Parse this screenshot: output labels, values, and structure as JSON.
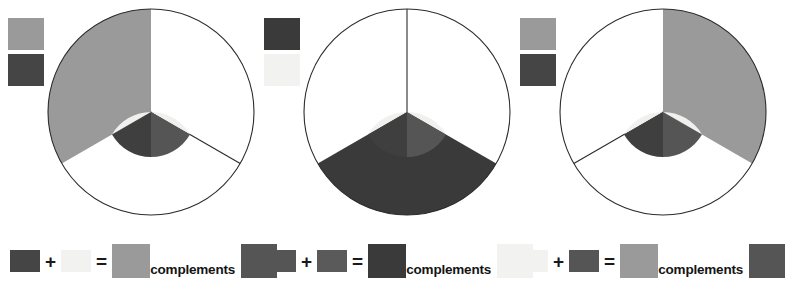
{
  "page": {
    "background": "#ffffff"
  },
  "palette": {
    "light": "#f0f0ee",
    "light_alt": "#f2f2f0",
    "medium_gray": "#9a9a9a",
    "mid_dark": "#555555",
    "dark": "#3f3f3f",
    "darker": "#3a3a3a",
    "outline": "#2b2b2b",
    "text": "#141414"
  },
  "wheel_geometry": {
    "outer_radius": 103,
    "inner_radius": 45,
    "center_x": 107,
    "center_y": 110,
    "sector_count": 3,
    "sector_span_degrees": 120,
    "sector_start_degrees": [
      0,
      120,
      240
    ],
    "sector_names": [
      "right",
      "bottom",
      "left"
    ]
  },
  "panels": [
    {
      "name": "panel-one",
      "swatches": {
        "top_color": "#9a9a9a",
        "bottom_color": "#454545"
      },
      "inner": {
        "top_color": "#f0f0ee",
        "bottom_right_color": "#555555",
        "bottom_left_color": "#3f3f3f"
      },
      "outer_filled_sectors": [
        {
          "start": 240,
          "end": 360,
          "color": "#9a9a9a"
        }
      ],
      "outer_outline_color": "#2b2b2b",
      "radial_lines_degrees": [
        120
      ]
    },
    {
      "name": "panel-two",
      "swatches": {
        "top_color": "#3a3a3a",
        "bottom_color": "#f2f2f0"
      },
      "inner": {
        "top_color": "#f0f0ee",
        "bottom_right_color": "#555555",
        "bottom_left_color": "#3f3f3f"
      },
      "outer_filled_sectors": [
        {
          "start": 120,
          "end": 240,
          "color": "#3a3a3a"
        }
      ],
      "outer_outline_color": "#2b2b2b",
      "radial_lines_degrees": [
        270
      ]
    },
    {
      "name": "panel-three",
      "swatches": {
        "top_color": "#9a9a9a",
        "bottom_color": "#454545"
      },
      "inner": {
        "top_color": "#f0f0ee",
        "bottom_right_color": "#555555",
        "bottom_left_color": "#3f3f3f"
      },
      "outer_filled_sectors": [
        {
          "start": 0,
          "end": 120,
          "color": "#9a9a9a"
        }
      ],
      "outer_outline_color": "#2b2b2b",
      "radial_lines_degrees": [
        240
      ]
    }
  ],
  "legends": [
    {
      "name": "legend-one",
      "a_color": "#454545",
      "plus": "+",
      "b_color": "#f2f2f0",
      "equals": "=",
      "result_color": "#9a9a9a",
      "word": "complements",
      "complement_color": "#555555"
    },
    {
      "name": "legend-two",
      "a_color": "#555555",
      "plus": "+",
      "b_color": "#5a5a5a",
      "equals": "=",
      "result_color": "#3a3a3a",
      "word": "complements",
      "complement_color": "#f2f2f0"
    },
    {
      "name": "legend-three",
      "a_color": "#f2f2f0",
      "plus": "+",
      "b_color": "#555555",
      "equals": "=",
      "result_color": "#9a9a9a",
      "word": "complements",
      "complement_color": "#555555"
    }
  ]
}
